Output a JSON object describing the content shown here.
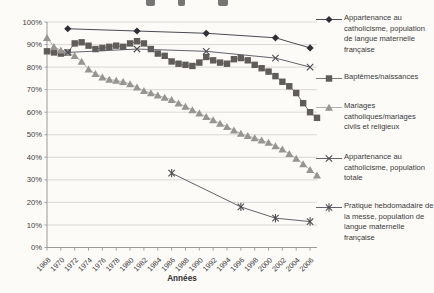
{
  "chart_data": {
    "type": "line",
    "title": "",
    "xlabel": "Années",
    "ylabel": "",
    "grid": true,
    "legend_position": "right",
    "x_range": [
      1968,
      2007
    ],
    "ylim": [
      0,
      100
    ],
    "y_tick_labels": [
      "0%",
      "10%",
      "20%",
      "30%",
      "40%",
      "50%",
      "60%",
      "70%",
      "80%",
      "90%",
      "100%"
    ],
    "x_tick_labels": [
      "1968",
      "1970",
      "1972",
      "1974",
      "1976",
      "1978",
      "1980",
      "1982",
      "1984",
      "1986",
      "1988",
      "1990",
      "1992",
      "1994",
      "1996",
      "1998",
      "2000",
      "2002",
      "2004",
      "2006"
    ],
    "series": [
      {
        "name": "Appartenance au catholicisme, population de langue maternelle française",
        "marker": "diamond",
        "color": "#2f2f38",
        "line_color": "#4a4a52",
        "x": [
          1971,
          1981,
          1991,
          2001,
          2006
        ],
        "values": [
          97,
          96,
          95,
          93,
          88.5
        ]
      },
      {
        "name": "Baptêmes/naissances",
        "marker": "square",
        "color": "#5f5c5a",
        "line_color": "#7a7876",
        "x": [
          1968,
          1969,
          1970,
          1971,
          1972,
          1973,
          1974,
          1975,
          1976,
          1977,
          1978,
          1979,
          1980,
          1981,
          1982,
          1983,
          1984,
          1985,
          1986,
          1987,
          1988,
          1989,
          1990,
          1991,
          1992,
          1993,
          1994,
          1995,
          1996,
          1997,
          1998,
          1999,
          2000,
          2001,
          2002,
          2003,
          2004,
          2005,
          2006,
          2007
        ],
        "values": [
          87,
          86.5,
          86,
          86.5,
          90.5,
          91,
          89.5,
          88,
          88.5,
          89,
          89.5,
          89,
          90.5,
          91.5,
          90.5,
          88,
          86,
          85,
          82.5,
          81.5,
          81,
          80.5,
          82,
          84.5,
          83,
          82,
          81.5,
          83.5,
          84,
          83,
          81,
          79.5,
          78,
          76,
          73.5,
          71.5,
          68.5,
          64,
          60,
          57.5
        ]
      },
      {
        "name": "Mariages catholiques/mariages civils et religieux",
        "marker": "triangle",
        "color": "#979592",
        "line_color": "#b3b1ae",
        "x": [
          1968,
          1969,
          1970,
          1971,
          1972,
          1973,
          1974,
          1975,
          1976,
          1977,
          1978,
          1979,
          1980,
          1981,
          1982,
          1983,
          1984,
          1985,
          1986,
          1987,
          1988,
          1989,
          1990,
          1991,
          1992,
          1993,
          1994,
          1995,
          1996,
          1997,
          1998,
          1999,
          2000,
          2001,
          2002,
          2003,
          2004,
          2005,
          2006,
          2007
        ],
        "values": [
          93,
          89,
          87.5,
          86.5,
          85,
          82.5,
          79,
          77,
          75.5,
          74.5,
          74,
          73.5,
          72.5,
          71,
          69.5,
          68.5,
          67.5,
          66.5,
          65.5,
          64,
          62.5,
          61,
          59.5,
          58,
          56.5,
          55,
          53.5,
          52,
          50.5,
          49.5,
          48.5,
          47.5,
          46.5,
          45,
          43.5,
          41.5,
          39.5,
          37,
          34.5,
          32
        ]
      },
      {
        "name": "Appartenance au catholicisme, population totale",
        "marker": "x",
        "color": "#4c4c52",
        "line_color": "#62626a",
        "x": [
          1971,
          1981,
          1991,
          2001,
          2006
        ],
        "values": [
          86.5,
          88,
          87,
          84,
          80
        ]
      },
      {
        "name": "Pratique hebdomadaire de la messe, population de langue maternelle française",
        "marker": "star",
        "color": "#4c4c52",
        "line_color": "#62626a",
        "x": [
          1986,
          1996,
          2001,
          2006
        ],
        "values": [
          33,
          18,
          13,
          11.5
        ]
      }
    ]
  },
  "axis": {
    "x_title": "Années"
  }
}
